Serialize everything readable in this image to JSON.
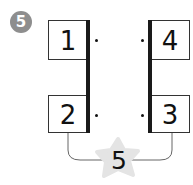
{
  "problem": {
    "number": "5",
    "boxes": {
      "top_left": "1",
      "bottom_left": "2",
      "bottom_right": "3",
      "top_right": "4"
    },
    "star_value": "5"
  },
  "colors": {
    "badge": "#8e8e8e",
    "star": "#e4e4e4",
    "bar": "#1a1a1a",
    "line": "#666666"
  }
}
